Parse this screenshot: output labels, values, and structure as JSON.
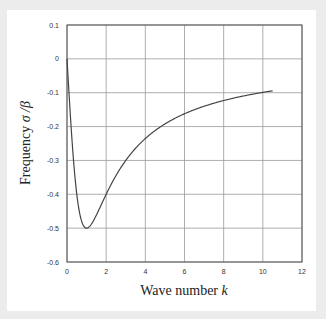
{
  "chart_data": {
    "type": "line",
    "title": "",
    "xlabel": "Wave number k",
    "ylabel": "Frequency σ/β",
    "xlim": [
      0,
      12
    ],
    "ylim": [
      -0.6,
      0.1
    ],
    "xticks": [
      "0",
      "2",
      "4",
      "6",
      "8",
      "10",
      "12"
    ],
    "yticks": [
      "0.1",
      "0",
      "-0.1",
      "-0.2",
      "-0.3",
      "-0.4",
      "-0.5",
      "-0.6"
    ],
    "grid": true,
    "legend": null,
    "series": [
      {
        "name": "σ/β",
        "x": [
          0,
          0.25,
          0.5,
          0.75,
          1.0,
          1.5,
          2,
          3,
          4,
          5,
          6,
          7,
          8,
          9,
          10,
          10.5
        ],
        "y": [
          0,
          -0.235,
          -0.4,
          -0.48,
          -0.5,
          -0.462,
          -0.4,
          -0.3,
          -0.235,
          -0.192,
          -0.162,
          -0.14,
          -0.123,
          -0.11,
          -0.099,
          -0.094
        ]
      }
    ]
  },
  "labels": {
    "x_main": "Wave number ",
    "x_var": "k",
    "y_main": "Frequency ",
    "y_var": "σ /β"
  }
}
